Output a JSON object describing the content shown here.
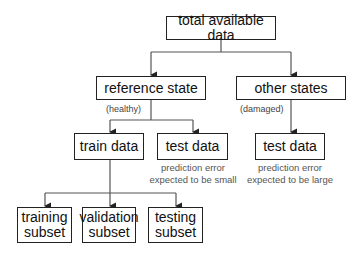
{
  "diagram": {
    "nodes": {
      "root": {
        "label": "total available data"
      },
      "reference": {
        "label": "reference state",
        "note": "(healthy)"
      },
      "other": {
        "label": "other states",
        "note": "(damaged)"
      },
      "train": {
        "label": "train data"
      },
      "test_ref": {
        "label": "test data",
        "caption_line1": "prediction error",
        "caption_line2": "expected to be small"
      },
      "test_other": {
        "label": "test data",
        "caption_line1": "prediction error",
        "caption_line2": "expected to be large"
      },
      "training_subset": {
        "line1": "training",
        "line2": "subset"
      },
      "validation_subset": {
        "line1": "validation",
        "line2": "subset"
      },
      "testing_subset": {
        "line1": "testing",
        "line2": "subset"
      }
    },
    "edges": [
      [
        "root",
        "reference"
      ],
      [
        "root",
        "other"
      ],
      [
        "reference",
        "train"
      ],
      [
        "reference",
        "test_ref"
      ],
      [
        "other",
        "test_other"
      ],
      [
        "train",
        "training_subset"
      ],
      [
        "train",
        "validation_subset"
      ],
      [
        "train",
        "testing_subset"
      ]
    ],
    "colors": {
      "line": "#333333",
      "box_border": "#222222",
      "caption": "#555555"
    }
  }
}
